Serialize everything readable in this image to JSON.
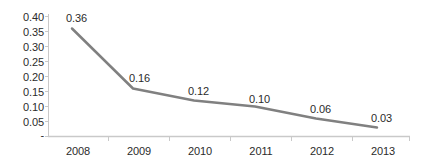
{
  "chart_data": {
    "type": "line",
    "title": "",
    "subtitle": "",
    "xlabel": "",
    "ylabel": "",
    "categories": [
      "2008",
      "2009",
      "2010",
      "2011",
      "2012",
      "2013"
    ],
    "series": [
      {
        "name": "",
        "values": [
          0.36,
          0.16,
          0.12,
          0.1,
          0.06,
          0.03
        ],
        "color": "#808080",
        "marker": "none",
        "line_width": 2.5
      }
    ],
    "data_labels": [
      "0.36",
      "0.16",
      "0.12",
      "0.10",
      "0.06",
      "0.03"
    ],
    "ylim": [
      0,
      0.4
    ],
    "y_ticks": [
      0,
      0.05,
      0.1,
      0.15,
      0.2,
      0.25,
      0.3,
      0.35,
      0.4
    ],
    "y_tick_labels": [
      "-",
      "0.05",
      "0.10",
      "0.15",
      "0.20",
      "0.25",
      "0.30",
      "0.35",
      "0.40"
    ],
    "grid": false,
    "legend": "none",
    "axis_color": "#c9c9c9",
    "text_color": "#2b2b2b",
    "background": "#ffffff"
  },
  "axes": {
    "y_labels": [
      {
        "text": "0.40",
        "top": 12
      },
      {
        "text": "0.35",
        "top": 27
      },
      {
        "text": "0.30",
        "top": 42
      },
      {
        "text": "0.25",
        "top": 57
      },
      {
        "text": "0.20",
        "top": 72
      },
      {
        "text": "0.15",
        "top": 87
      },
      {
        "text": "0.10",
        "top": 102
      },
      {
        "text": "0.05",
        "top": 117
      },
      {
        "text": "-",
        "top": 130
      }
    ],
    "x_labels": [
      {
        "text": "2008",
        "left": 78,
        "top": 146
      },
      {
        "text": "2009",
        "left": 139,
        "top": 146
      },
      {
        "text": "2010",
        "left": 200,
        "top": 146
      },
      {
        "text": "2011",
        "left": 261,
        "top": 146
      },
      {
        "text": "2012",
        "left": 322,
        "top": 146
      },
      {
        "text": "2013",
        "left": 383,
        "top": 146
      }
    ]
  },
  "point_labels": [
    {
      "text": "0.36",
      "left": 66,
      "top": 13
    },
    {
      "text": "0.16",
      "left": 129,
      "top": 73
    },
    {
      "text": "0.12",
      "left": 188,
      "top": 86
    },
    {
      "text": "0.10",
      "left": 249,
      "top": 94
    },
    {
      "text": "0.06",
      "left": 310,
      "top": 104
    },
    {
      "text": "0.03",
      "left": 371,
      "top": 113
    }
  ]
}
